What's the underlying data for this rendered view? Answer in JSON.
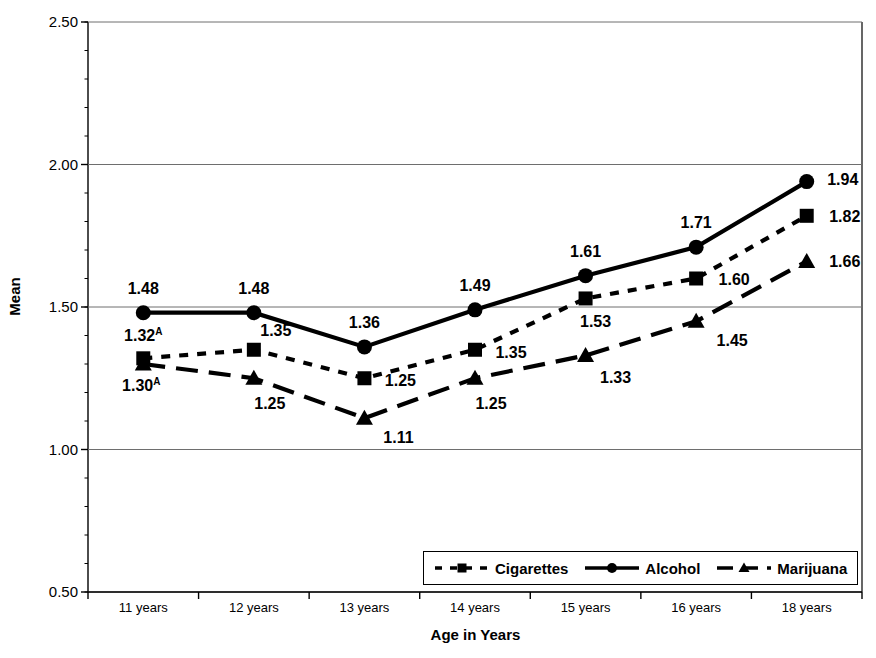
{
  "chart_data": {
    "type": "line",
    "title": "",
    "xlabel": "Age in Years",
    "ylabel": "Mean",
    "categories": [
      "11 years",
      "12 years",
      "13 years",
      "14 years",
      "15 years",
      "16 years",
      "18 years"
    ],
    "ylim": [
      0.5,
      2.5
    ],
    "yticks": [
      "0.50",
      "1.00",
      "1.50",
      "2.00",
      "2.50"
    ],
    "ytick_values": [
      0.5,
      1.0,
      1.5,
      2.0,
      2.5
    ],
    "grid": true,
    "legend_position": "bottom-right-inside",
    "series": [
      {
        "name": "Cigarettes",
        "marker": "square",
        "line_style": "dotted",
        "color": "#000000",
        "values": [
          1.32,
          1.35,
          1.25,
          1.35,
          1.53,
          1.6,
          1.82
        ],
        "labels": [
          "1.32",
          "1.35",
          "1.25",
          "1.35",
          "1.53",
          "1.60",
          "1.82"
        ],
        "annotations": [
          "A",
          "",
          "",
          "",
          "",
          "",
          ""
        ]
      },
      {
        "name": "Alcohol",
        "marker": "circle",
        "line_style": "solid",
        "color": "#000000",
        "values": [
          1.48,
          1.48,
          1.36,
          1.49,
          1.61,
          1.71,
          1.94
        ],
        "labels": [
          "1.48",
          "1.48",
          "1.36",
          "1.49",
          "1.61",
          "1.71",
          "1.94"
        ],
        "annotations": [
          "",
          "",
          "",
          "",
          "",
          "",
          ""
        ]
      },
      {
        "name": "Marijuana",
        "marker": "triangle",
        "line_style": "dashed",
        "color": "#000000",
        "values": [
          1.3,
          1.25,
          1.11,
          1.25,
          1.33,
          1.45,
          1.66
        ],
        "labels": [
          "1.30",
          "1.25",
          "1.11",
          "1.25",
          "1.33",
          "1.45",
          "1.66"
        ],
        "annotations": [
          "A",
          "",
          "",
          "",
          "",
          "",
          ""
        ]
      }
    ],
    "label_offsets": {
      "Cigarettes": [
        {
          "dx": 0,
          "dy": -22
        },
        {
          "dx": 22,
          "dy": -19
        },
        {
          "dx": 36,
          "dy": 3
        },
        {
          "dx": 36,
          "dy": 3
        },
        {
          "dx": 10,
          "dy": 24
        },
        {
          "dx": 38,
          "dy": 1
        },
        {
          "dx": 38,
          "dy": 1
        }
      ],
      "Alcohol": [
        {
          "dx": 0,
          "dy": -24
        },
        {
          "dx": 0,
          "dy": -24
        },
        {
          "dx": 0,
          "dy": -24
        },
        {
          "dx": 0,
          "dy": -24
        },
        {
          "dx": 0,
          "dy": -24
        },
        {
          "dx": 0,
          "dy": -24
        },
        {
          "dx": 36,
          "dy": -2
        }
      ],
      "Marijuana": [
        {
          "dx": -2,
          "dy": 22
        },
        {
          "dx": 16,
          "dy": 26
        },
        {
          "dx": 34,
          "dy": 20
        },
        {
          "dx": 16,
          "dy": 26
        },
        {
          "dx": 30,
          "dy": 23
        },
        {
          "dx": 36,
          "dy": 20
        },
        {
          "dx": 38,
          "dy": 1
        }
      ]
    }
  },
  "legend": {
    "items": [
      {
        "label": "Cigarettes",
        "style": "dotted",
        "marker": "square"
      },
      {
        "label": "Alcohol",
        "style": "solid",
        "marker": "circle"
      },
      {
        "label": "Marijuana",
        "style": "dashed",
        "marker": "triangle"
      }
    ]
  }
}
